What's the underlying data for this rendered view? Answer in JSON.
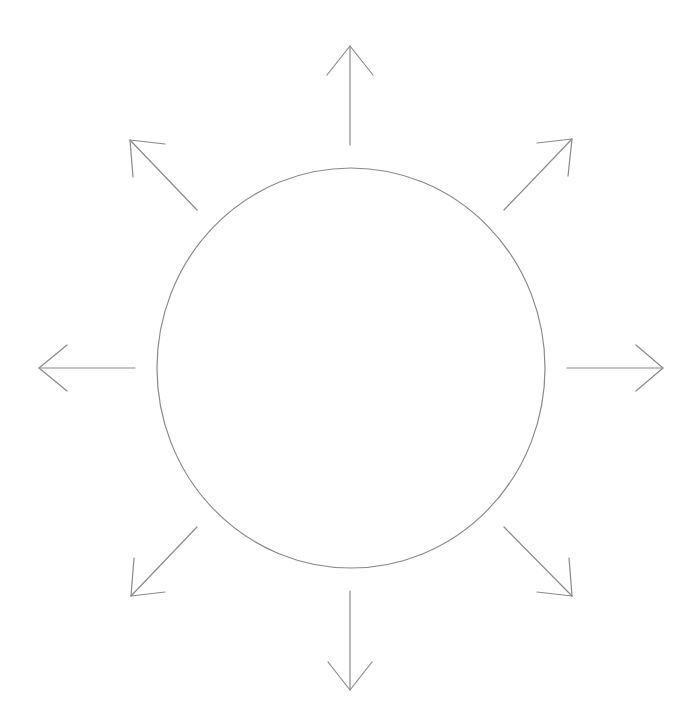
{
  "diagram": {
    "canvas": {
      "width": 696,
      "height": 726,
      "background": "#ffffff"
    },
    "stroke_color": "#8a8a8a",
    "stroke_width": 1.2,
    "circle": {
      "cx": 351,
      "cy": 368,
      "rx": 194,
      "ry": 200
    },
    "arrows": [
      {
        "direction": "up",
        "shaft": [
          350,
          145,
          350,
          46
        ],
        "wing1": [
          327,
          75
        ],
        "wing2": [
          373,
          75
        ]
      },
      {
        "direction": "up-right",
        "shaft": [
          504,
          210,
          572,
          139
        ],
        "wing1": [
          537,
          143
        ],
        "wing2": [
          568,
          176
        ]
      },
      {
        "direction": "right",
        "shaft": [
          567,
          368,
          663,
          368
        ],
        "wing1": [
          636,
          345
        ],
        "wing2": [
          636,
          391
        ]
      },
      {
        "direction": "down-right",
        "shaft": [
          504,
          527,
          572,
          596
        ],
        "wing1": [
          569,
          558
        ],
        "wing2": [
          537,
          592
        ]
      },
      {
        "direction": "down",
        "shaft": [
          350,
          591,
          350,
          690
        ],
        "wing1": [
          328,
          662
        ],
        "wing2": [
          372,
          662
        ]
      },
      {
        "direction": "down-left",
        "shaft": [
          197,
          527,
          131,
          596
        ],
        "wing1": [
          134,
          558
        ],
        "wing2": [
          165,
          592
        ]
      },
      {
        "direction": "left",
        "shaft": [
          135,
          368,
          39,
          368
        ],
        "wing1": [
          67,
          345
        ],
        "wing2": [
          67,
          391
        ]
      },
      {
        "direction": "up-left",
        "shaft": [
          197,
          210,
          130,
          140
        ],
        "wing1": [
          165,
          144
        ],
        "wing2": [
          133,
          177
        ]
      }
    ]
  }
}
